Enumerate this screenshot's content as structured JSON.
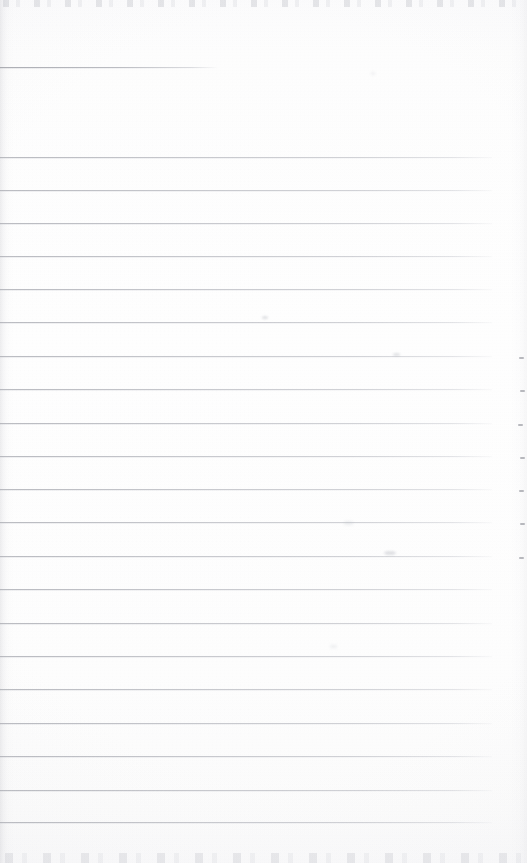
{
  "document": {
    "kind": "scanned-ruled-notepad-page",
    "title": "",
    "page_width": 527,
    "page_height": 863,
    "text_content": "",
    "is_blank": true,
    "handwriting_present": false,
    "printed_text_present": false
  },
  "colors": {
    "paper": "#fdfdfd",
    "paper_edge": "#f9f9fa",
    "rule_line": "#9ea0a8",
    "rule_line_soft": "#babcc4",
    "artifact_speck": "#b0b2ba",
    "margin_tick": "#80828a",
    "shadow_left": "#aaaab2"
  },
  "layout": {
    "rule_left_x": 0,
    "rule_right_x": 492,
    "rule_spacing": 33.3,
    "first_full_rule_y": 157,
    "last_full_rule_y": 822,
    "full_rule_count": 21,
    "top_margin_height": 157,
    "right_margin_width": 35
  },
  "partial_rule": {
    "label": "short-top-rule",
    "y": 67,
    "x_start": 0,
    "x_end": 217,
    "width": 217
  },
  "rules": [
    {
      "y": 157,
      "width": 492
    },
    {
      "y": 190,
      "width": 492
    },
    {
      "y": 223,
      "width": 492
    },
    {
      "y": 256,
      "width": 492
    },
    {
      "y": 289,
      "width": 492
    },
    {
      "y": 322,
      "width": 492
    },
    {
      "y": 356,
      "width": 492
    },
    {
      "y": 389,
      "width": 492
    },
    {
      "y": 423,
      "width": 492
    },
    {
      "y": 456,
      "width": 492
    },
    {
      "y": 489,
      "width": 492
    },
    {
      "y": 522,
      "width": 492
    },
    {
      "y": 556,
      "width": 492
    },
    {
      "y": 589,
      "width": 492
    },
    {
      "y": 623,
      "width": 492
    },
    {
      "y": 656,
      "width": 492
    },
    {
      "y": 689,
      "width": 492
    },
    {
      "y": 723,
      "width": 492
    },
    {
      "y": 756,
      "width": 492
    },
    {
      "y": 790,
      "width": 492
    },
    {
      "y": 822,
      "width": 492
    }
  ],
  "margin_ticks": [
    {
      "x": 519,
      "y": 357
    },
    {
      "x": 520,
      "y": 390
    },
    {
      "x": 518,
      "y": 424
    },
    {
      "x": 520,
      "y": 457
    },
    {
      "x": 519,
      "y": 490
    },
    {
      "x": 520,
      "y": 523
    },
    {
      "x": 519,
      "y": 557
    }
  ],
  "smudges": [
    {
      "x": 393,
      "y": 353,
      "w": 7,
      "h": 3
    },
    {
      "x": 344,
      "y": 521,
      "w": 9,
      "h": 4
    },
    {
      "x": 384,
      "y": 551,
      "w": 12,
      "h": 4
    },
    {
      "x": 371,
      "y": 72,
      "w": 4,
      "h": 3
    },
    {
      "x": 262,
      "y": 316,
      "w": 6,
      "h": 3
    },
    {
      "x": 330,
      "y": 645,
      "w": 7,
      "h": 3
    }
  ],
  "artifacts": {
    "top_edge_band": {
      "y": 0,
      "height": 7,
      "description": "dotted-scan-noise"
    },
    "bottom_edge_band": {
      "y": 853,
      "height": 10,
      "description": "dotted-scan-noise"
    },
    "left_edge_shadow": {
      "x": 0,
      "width": 14,
      "description": "binding-shadow-gradient"
    },
    "right_edge_shadow": {
      "x": 511,
      "width": 16,
      "description": "edge-shadow-gradient"
    }
  }
}
